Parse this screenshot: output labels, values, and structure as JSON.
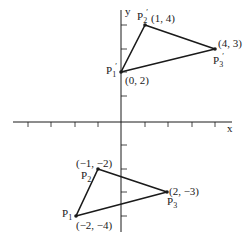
{
  "figure": {
    "axes": {
      "x_label": "x",
      "y_label": "y"
    },
    "triangle_image": {
      "points": [
        {
          "name": "P",
          "sub": "1",
          "prime": "′",
          "coord": "(0, 2)",
          "x": 0,
          "y": 2
        },
        {
          "name": "P",
          "sub": "2",
          "prime": "′",
          "coord": "(1, 4)",
          "x": 1,
          "y": 4
        },
        {
          "name": "P",
          "sub": "3",
          "prime": "′",
          "coord": "(4, 3)",
          "x": 4,
          "y": 3
        }
      ]
    },
    "triangle_original": {
      "points": [
        {
          "name": "P",
          "sub": "1",
          "coord": "(−2, −4)",
          "x": -2,
          "y": -4
        },
        {
          "name": "P",
          "sub": "2",
          "coord": "(−1, −2)",
          "x": -1,
          "y": -2
        },
        {
          "name": "P",
          "sub": "3",
          "coord": "(2, −3)",
          "x": 2,
          "y": -3
        }
      ]
    },
    "colors": {
      "ink": "#1a1a1a",
      "background": "#ffffff"
    }
  }
}
